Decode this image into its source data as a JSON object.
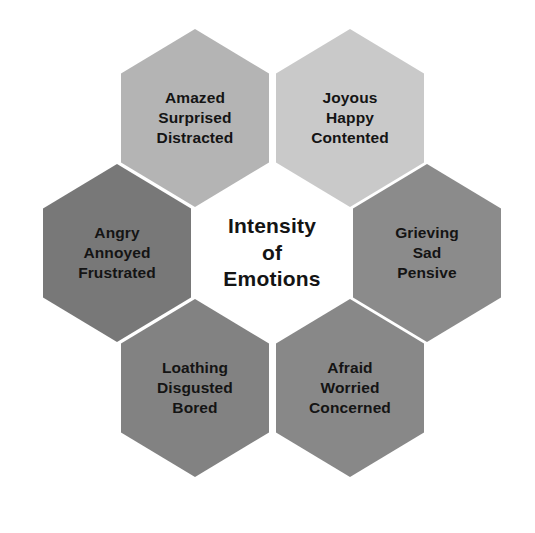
{
  "diagram": {
    "title": "Intensity of Emotions",
    "type": "hexagon-flower",
    "background_color": "#ffffff",
    "text_color": "#141414",
    "center": {
      "id": "center",
      "position": "center",
      "fill": "#ffffff",
      "lines": [
        "Intensity",
        "of",
        "Emotions"
      ]
    },
    "petals": [
      {
        "id": "top-left",
        "position": "top-left",
        "fill": "#b4b4b4",
        "lines": [
          "Amazed",
          "Surprised",
          "Distracted"
        ]
      },
      {
        "id": "top-right",
        "position": "top-right",
        "fill": "#c9c9c9",
        "lines": [
          "Joyous",
          "Happy",
          "Contented"
        ]
      },
      {
        "id": "left",
        "position": "left",
        "fill": "#787878",
        "lines": [
          "Angry",
          "Annoyed",
          "Frustrated"
        ]
      },
      {
        "id": "right",
        "position": "right",
        "fill": "#8b8b8b",
        "lines": [
          "Grieving",
          "Sad",
          "Pensive"
        ]
      },
      {
        "id": "bottom-left",
        "position": "bottom-left",
        "fill": "#828282",
        "lines": [
          "Loathing",
          "Disgusted",
          "Bored"
        ]
      },
      {
        "id": "bottom-right",
        "position": "bottom-right",
        "fill": "#888888",
        "lines": [
          "Afraid",
          "Worried",
          "Concerned"
        ]
      }
    ]
  }
}
